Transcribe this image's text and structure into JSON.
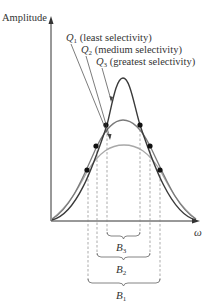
{
  "axes": {
    "y_label": "Amplitude",
    "x_label": "ω"
  },
  "curves": [
    {
      "id": "Q1",
      "label_main": "Q",
      "label_sub": "1",
      "label_text": " (least selectivity)",
      "color": "#9a9a9a"
    },
    {
      "id": "Q2",
      "label_main": "Q",
      "label_sub": "2",
      "label_text": " (medium selectivity)",
      "color": "#6e6e6e"
    },
    {
      "id": "Q3",
      "label_main": "Q",
      "label_sub": "3",
      "label_text": " (greatest selectivity)",
      "color": "#3a3a3a"
    }
  ],
  "bandwidths": [
    {
      "id": "B3",
      "label_main": "B",
      "label_sub": "3"
    },
    {
      "id": "B2",
      "label_main": "B",
      "label_sub": "2"
    },
    {
      "id": "B1",
      "label_main": "B",
      "label_sub": "1"
    }
  ],
  "colors": {
    "axis": "#333333",
    "dashed": "#888888",
    "dot": "#111111"
  }
}
